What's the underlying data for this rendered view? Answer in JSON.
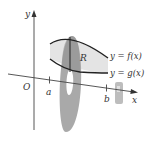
{
  "diagram": {
    "type": "solid-of-revolution-washer",
    "axes": {
      "x_label": "x",
      "y_label": "y",
      "origin_label": "O"
    },
    "ticks": {
      "a_label": "a",
      "b_label": "b"
    },
    "region_label": "R",
    "curves": {
      "upper_label": "y = f(x)",
      "lower_label": "y = g(x)"
    },
    "colors": {
      "region_fill": "#e4e4e4",
      "washer_fill": "#a9a9a9",
      "curve_stroke": "#222222",
      "axis_stroke": "#444444"
    }
  }
}
